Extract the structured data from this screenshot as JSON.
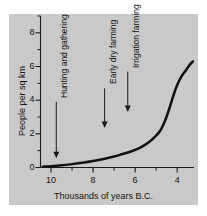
{
  "chart_data": {
    "type": "line",
    "title": "",
    "xlabel": "Thousands of years B.C.",
    "ylabel": "People per sq km",
    "xlim": [
      10.5,
      3.2
    ],
    "ylim": [
      0,
      9
    ],
    "x_reversed": true,
    "grid": false,
    "legend": "none",
    "xticks": [
      10,
      9,
      8,
      7,
      6,
      5,
      4
    ],
    "xtick_labels": [
      "10",
      "",
      "8",
      "",
      "6",
      "",
      "4"
    ],
    "xtick_major": [
      10,
      8,
      6,
      4
    ],
    "yticks": [
      0,
      1,
      2,
      3,
      4,
      5,
      6,
      7,
      8,
      9
    ],
    "ytick_labels": [
      "0",
      "",
      "2",
      "",
      "4",
      "",
      "6",
      "",
      "8",
      ""
    ],
    "ytick_major": [
      0,
      2,
      4,
      6,
      8
    ],
    "series": [
      {
        "name": "Population density",
        "x": [
          10.4,
          10.0,
          9.5,
          9.0,
          8.5,
          8.0,
          7.5,
          7.0,
          6.6,
          6.2,
          5.8,
          5.4,
          5.0,
          4.8,
          4.6,
          4.4,
          4.2,
          4.0,
          3.8,
          3.6,
          3.4,
          3.25
        ],
        "values": [
          0.05,
          0.08,
          0.13,
          0.2,
          0.28,
          0.38,
          0.5,
          0.65,
          0.8,
          0.95,
          1.15,
          1.45,
          1.9,
          2.2,
          2.7,
          3.4,
          4.2,
          4.9,
          5.4,
          5.75,
          6.1,
          6.3
        ]
      }
    ],
    "annotations": [
      {
        "label": "Hunting and gathering",
        "x": 9.75,
        "arrow_from_y": 3.9,
        "arrow_to_y": 0.55
      },
      {
        "label": "Early dry farming",
        "x": 7.45,
        "arrow_from_y": 4.7,
        "arrow_to_y": 2.35
      },
      {
        "label": "Irrigation farming",
        "x": 6.35,
        "arrow_from_y": 5.7,
        "arrow_to_y": 3.3
      }
    ],
    "colors": {
      "panel_background": "#c9c9c9",
      "figure_background": "#ffffff",
      "curve": "#111111",
      "axis": "#1a1a1a",
      "text": "#141414"
    }
  }
}
